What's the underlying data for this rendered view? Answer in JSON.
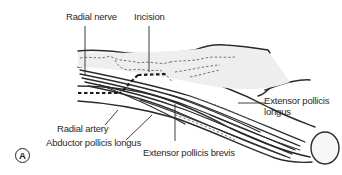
{
  "figure": {
    "panel_label": "A",
    "labels": {
      "radial_nerve": "Radial nerve",
      "incision": "Incision",
      "extensor_pollicis_longus_line1": "Extensor pollicis",
      "extensor_pollicis_longus_line2": "longus",
      "radial_artery": "Radial artery",
      "abductor_pollicis_longus": "Abductor pollicis longus",
      "extensor_pollicis_brevis": "Extensor pollicis brevis"
    }
  }
}
